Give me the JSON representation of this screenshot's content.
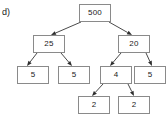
{
  "figure": {
    "part_label": "d)",
    "background_color": "#ffffff",
    "box_border_color": "#8a8a8a",
    "edge_color": "#4a4a4a",
    "text_color": "#1a1a1a"
  },
  "nodes": [
    {
      "id": "root",
      "label": "500",
      "x": 79,
      "y": 4,
      "w": 32,
      "h": 18
    },
    {
      "id": "n25",
      "label": "25",
      "x": 33,
      "y": 35,
      "w": 32,
      "h": 18
    },
    {
      "id": "n20",
      "label": "20",
      "x": 118,
      "y": 35,
      "w": 32,
      "h": 18
    },
    {
      "id": "l5a",
      "label": "5",
      "x": 17,
      "y": 66,
      "w": 32,
      "h": 18
    },
    {
      "id": "l5b",
      "label": "5",
      "x": 58,
      "y": 66,
      "w": 32,
      "h": 18
    },
    {
      "id": "n4",
      "label": "4",
      "x": 100,
      "y": 66,
      "w": 32,
      "h": 18
    },
    {
      "id": "l5c",
      "label": "5",
      "x": 134,
      "y": 66,
      "w": 32,
      "h": 18
    },
    {
      "id": "l2a",
      "label": "2",
      "x": 78,
      "y": 96,
      "w": 32,
      "h": 18
    },
    {
      "id": "l2b",
      "label": "2",
      "x": 118,
      "y": 96,
      "w": 32,
      "h": 18
    }
  ],
  "edges": [
    {
      "from": "root",
      "to": "n25",
      "x1": 81,
      "y1": 22,
      "x2": 51,
      "y2": 35
    },
    {
      "from": "root",
      "to": "n20",
      "x1": 109,
      "y1": 22,
      "x2": 132,
      "y2": 35
    },
    {
      "from": "n25",
      "to": "l5a",
      "x1": 37,
      "y1": 53,
      "x2": 27,
      "y2": 66
    },
    {
      "from": "n25",
      "to": "l5b",
      "x1": 61,
      "y1": 53,
      "x2": 72,
      "y2": 66
    },
    {
      "from": "n20",
      "to": "n4",
      "x1": 121,
      "y1": 53,
      "x2": 110,
      "y2": 66
    },
    {
      "from": "n20",
      "to": "l5c",
      "x1": 146,
      "y1": 53,
      "x2": 152,
      "y2": 66
    },
    {
      "from": "n4",
      "to": "l2a",
      "x1": 103,
      "y1": 84,
      "x2": 92,
      "y2": 96
    },
    {
      "from": "n4",
      "to": "l2b",
      "x1": 128,
      "y1": 84,
      "x2": 134,
      "y2": 96
    }
  ]
}
